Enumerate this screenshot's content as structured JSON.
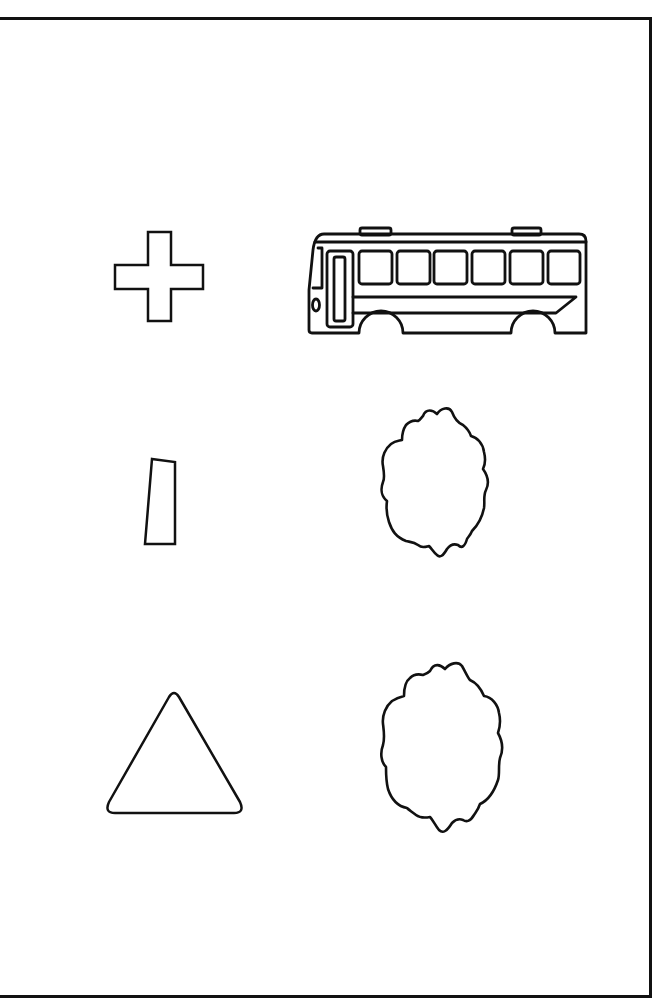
{
  "page": {
    "background": "#ffffff",
    "stroke_color": "#111111"
  },
  "shapes": [
    {
      "name": "cross",
      "label": "plus / cross shape",
      "row": 1,
      "col": 1
    },
    {
      "name": "bus",
      "label": "bus",
      "row": 1,
      "col": 2
    },
    {
      "name": "quadrilateral",
      "label": "narrow quadrilateral",
      "row": 2,
      "col": 1
    },
    {
      "name": "cloud-1",
      "label": "cloud shape",
      "row": 2,
      "col": 2
    },
    {
      "name": "triangle",
      "label": "triangle",
      "row": 3,
      "col": 1
    },
    {
      "name": "cloud-2",
      "label": "cloud shape",
      "row": 3,
      "col": 2
    }
  ]
}
